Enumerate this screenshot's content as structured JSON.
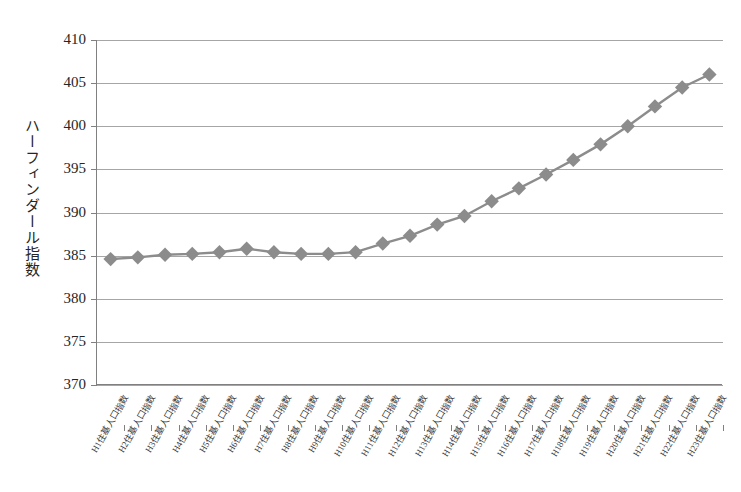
{
  "chart": {
    "title": "",
    "y_axis_title": "ハーフィンダール指数",
    "marker_color": "#8c8c8c",
    "line_color": "#8c8c8c",
    "grid_color": "#a6a6a6",
    "axis_color": "#808080"
  },
  "chart_data": {
    "type": "line",
    "title": "",
    "xlabel": "",
    "ylabel": "ハーフィンダール指数",
    "ylim": [
      370,
      410
    ],
    "ytick_values": [
      370,
      375,
      380,
      385,
      390,
      395,
      400,
      405,
      410
    ],
    "ytick_labels": [
      "370",
      "375",
      "380",
      "385",
      "390",
      "395",
      "400",
      "405",
      "410"
    ],
    "grid": true,
    "legend": "none",
    "marker": "diamond",
    "categories": [
      "H1住基人口指数",
      "H2住基人口指数",
      "H3住基人口指数",
      "H4住基人口指数",
      "H5住基人口指数",
      "H6住基人口指数",
      "H7住基人口指数",
      "H8住基人口指数",
      "H9住基人口指数",
      "H10住基人口指数",
      "H11住基人口指数",
      "H12住基人口指数",
      "H13住基人口指数",
      "H14住基人口指数",
      "H15住基人口指数",
      "H16住基人口指数",
      "H17住基人口指数",
      "H18住基人口指数",
      "H19住基人口指数",
      "H20住基人口指数",
      "H21住基人口指数",
      "H22住基人口指数",
      "H23住基人口指数"
    ],
    "values": [
      384.6,
      384.8,
      385.1,
      385.2,
      385.4,
      385.8,
      385.4,
      385.2,
      385.2,
      385.4,
      386.4,
      387.3,
      388.6,
      389.6,
      391.3,
      392.8,
      394.4,
      396.1,
      397.9,
      400.0,
      402.3,
      404.5,
      406.0
    ],
    "series": [
      {
        "name": "ハーフィンダール指数",
        "values": [
          384.6,
          384.8,
          385.1,
          385.2,
          385.4,
          385.8,
          385.4,
          385.2,
          385.2,
          385.4,
          386.4,
          387.3,
          388.6,
          389.6,
          391.3,
          392.8,
          394.4,
          396.1,
          397.9,
          400.0,
          402.3,
          404.5,
          406.0
        ]
      }
    ]
  }
}
